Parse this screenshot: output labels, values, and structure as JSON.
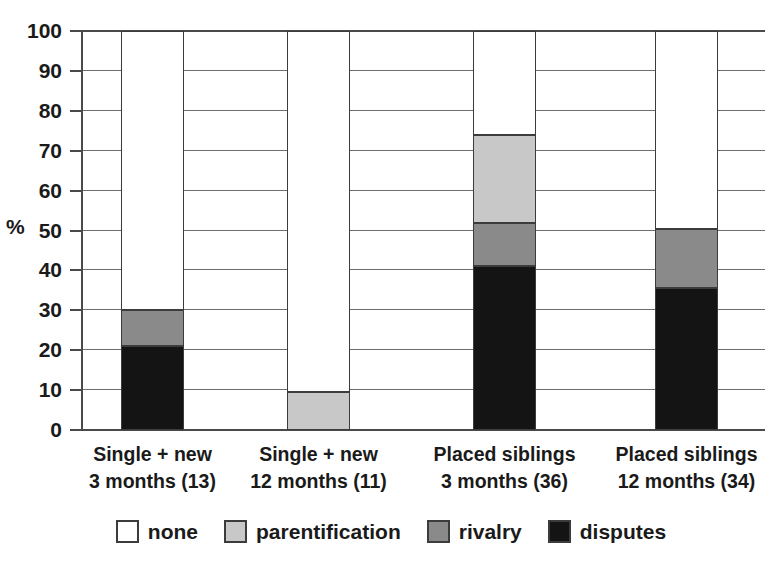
{
  "chart_data": {
    "type": "bar",
    "subtype": "stacked-bar-100",
    "title": "",
    "xlabel": "",
    "ylabel": "%",
    "ylim": [
      0,
      100
    ],
    "yticks": [
      0,
      10,
      20,
      30,
      40,
      50,
      60,
      70,
      80,
      90,
      100
    ],
    "grid": true,
    "legend_position": "bottom",
    "categories": [
      "Single + new\n3 months (13)",
      "Single + new\n12 months (11)",
      "Placed siblings\n3 months (36)",
      "Placed siblings\n12 months (34)"
    ],
    "category_lines": [
      {
        "line1": "Single + new",
        "line2": "3 months (13)"
      },
      {
        "line1": "Single + new",
        "line2": "12 months (11)"
      },
      {
        "line1": "Placed siblings",
        "line2": "3 months (36)"
      },
      {
        "line1": "Placed siblings",
        "line2": "12 months (34)"
      }
    ],
    "series": [
      {
        "name": "disputes",
        "color": "#141414",
        "values": [
          21,
          0,
          41,
          35.5
        ]
      },
      {
        "name": "rivalry",
        "color": "#8a8a8a",
        "values": [
          9,
          0,
          11,
          15
        ]
      },
      {
        "name": "parentification",
        "color": "#c8c8c8",
        "values": [
          0,
          9.5,
          22,
          0
        ]
      },
      {
        "name": "none",
        "color": "#ffffff",
        "values": [
          70,
          90.5,
          26,
          49.5
        ]
      }
    ],
    "stack_order_bottom_to_top": [
      "disputes",
      "rivalry",
      "parentification",
      "none"
    ],
    "cumulative_tops": [
      {
        "disputes": 21,
        "rivalry": 30,
        "parentification": 30,
        "none": 100
      },
      {
        "disputes": 0,
        "rivalry": 0,
        "parentification": 9.5,
        "none": 100
      },
      {
        "disputes": 41,
        "rivalry": 52,
        "parentification": 74,
        "none": 100
      },
      {
        "disputes": 35.5,
        "rivalry": 50.5,
        "parentification": 50.5,
        "none": 100
      }
    ]
  },
  "axis": {
    "unit_label": "%",
    "tick_labels": [
      "100",
      "90",
      "80",
      "70",
      "60",
      "50",
      "40",
      "30",
      "20",
      "10",
      "0"
    ]
  },
  "legend": {
    "items": [
      {
        "label": "none",
        "color": "#ffffff"
      },
      {
        "label": "parentification",
        "color": "#c8c8c8"
      },
      {
        "label": "rivalry",
        "color": "#8a8a8a"
      },
      {
        "label": "disputes",
        "color": "#141414"
      }
    ]
  },
  "colors": {
    "none": "#ffffff",
    "parentification": "#c8c8c8",
    "rivalry": "#8a8a8a",
    "disputes": "#141414",
    "axis": "#4a4a4a",
    "grid": "#6e6e6e",
    "text": "#1a1a1a",
    "background": "#ffffff"
  }
}
